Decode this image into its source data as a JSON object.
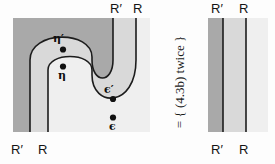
{
  "figure": {
    "kind": "string-diagram-equation",
    "colors": {
      "region_dark": "#a9a9a9",
      "region_mid": "#d9d9d9",
      "region_light": "#efefef",
      "background": "#fdfdfd",
      "stroke": "#1c1c1c",
      "dot": "#111111"
    }
  },
  "left_diagram": {
    "name": "zigzag-diagram",
    "top_labels": [
      {
        "id": "top-R-prime",
        "text": "R′",
        "x": 112,
        "y": 3
      },
      {
        "id": "top-R",
        "text": "R",
        "x": 138,
        "y": 3
      }
    ],
    "bottom_labels": [
      {
        "id": "bottom-R-prime",
        "text": "R′",
        "x": 12,
        "y": 146
      },
      {
        "id": "bottom-R",
        "text": "R",
        "x": 38,
        "y": 146
      }
    ],
    "nodes": [
      {
        "id": "node-eta-prime",
        "label": "η′",
        "cx": 63,
        "cy": 50,
        "label_x": 52,
        "label_y": 33
      },
      {
        "id": "node-eta",
        "label": "η",
        "cx": 63,
        "cy": 67,
        "label_x": 58,
        "label_y": 72
      },
      {
        "id": "node-epsilon-prime",
        "label": "ϵ′",
        "cx": 114,
        "cy": 99,
        "label_x": 105,
        "label_y": 84
      },
      {
        "id": "node-epsilon",
        "label": "ϵ",
        "cx": 114,
        "cy": 117,
        "label_x": 110,
        "label_y": 123
      }
    ]
  },
  "connector": {
    "name": "equation-connector",
    "text": "=  {  (4.3b) twice  }",
    "equals": "=",
    "brace_open": "{",
    "reference": "(4.3b)",
    "qualifier": "twice",
    "brace_close": "}"
  },
  "right_diagram": {
    "name": "parallel-strands-diagram",
    "top_labels": [
      {
        "id": "top-R-prime",
        "text": "R′",
        "x": 14,
        "y": 3
      },
      {
        "id": "top-R",
        "text": "R",
        "x": 41,
        "y": 3
      }
    ],
    "bottom_labels": [
      {
        "id": "bottom-R-prime",
        "text": "R′",
        "x": 14,
        "y": 146
      },
      {
        "id": "bottom-R",
        "text": "R",
        "x": 41,
        "y": 146
      }
    ],
    "strands": [
      {
        "id": "strand-R-prime",
        "x": 25
      },
      {
        "id": "strand-R",
        "x": 48
      }
    ]
  }
}
